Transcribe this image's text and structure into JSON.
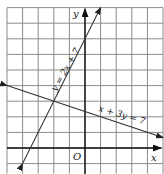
{
  "chart_data": {
    "type": "line",
    "title": "",
    "xlabel": "x",
    "ylabel": "y",
    "origin_label": "O",
    "xlim": [
      -5,
      5
    ],
    "ylim": [
      -1,
      9
    ],
    "grid": true,
    "grid_step": 1,
    "tick_labels": "none",
    "series": [
      {
        "name": "y = 2x + 7",
        "equation": "y = 2x + 7",
        "slope": 2,
        "intercept": 7,
        "points": [
          [
            -4,
            -1
          ],
          [
            1,
            9
          ]
        ],
        "arrows": "both"
      },
      {
        "name": "x + 3y = 7",
        "equation": "x + 3y = 7",
        "slope": -0.3333,
        "intercept": 2.3333,
        "points": [
          [
            -5,
            4
          ],
          [
            5,
            0.6667
          ]
        ],
        "arrows": "both"
      }
    ],
    "intersection": [
      -2,
      3
    ],
    "annotations": [
      "y = 2x + 7",
      "x + 3y = 7",
      "O",
      "x",
      "y"
    ]
  },
  "labels": {
    "x_axis": "x",
    "y_axis": "y",
    "origin": "O",
    "line1": "y = 2x + 7",
    "line2": "x + 3y = 7"
  },
  "colors": {
    "grid": "#8a8a8a",
    "axis": "#111111",
    "lines": "#333333",
    "background": "#ffffff"
  }
}
